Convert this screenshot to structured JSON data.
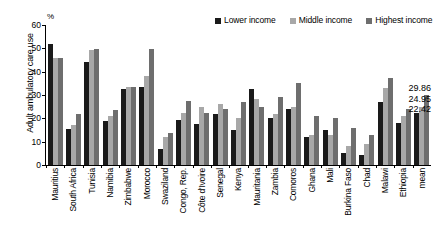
{
  "chart_data": {
    "type": "bar",
    "title": "",
    "xlabel": "",
    "ylabel": "Adult ambulatory care use",
    "unit_label": "%",
    "ylim": [
      0,
      60
    ],
    "yticks": [
      0,
      10,
      20,
      30,
      40,
      50,
      60
    ],
    "grid": false,
    "legend_position": "top-right",
    "categories": [
      "Mauritius",
      "South Africa",
      "Tunisia",
      "Namibia",
      "Zimbabwe",
      "Morocco",
      "Swaziland",
      "Congo, Rep.",
      "Côte d'Ivoire",
      "Senegal",
      "Kenya",
      "Mauritania",
      "Zambia",
      "Comoros",
      "Ghana",
      "Mali",
      "Burkina Faso",
      "Chad",
      "Malawi",
      "Ethiopia",
      "mean"
    ],
    "series": [
      {
        "name": "Lower income",
        "color": "#1a1a1a",
        "values": [
          51.8,
          15.5,
          44.2,
          19.0,
          32.7,
          33.6,
          6.8,
          19.2,
          17.6,
          22.0,
          15.2,
          32.6,
          20.0,
          24.2,
          12.0,
          15.0,
          5.0,
          4.2,
          27.2,
          18.0,
          22.42
        ]
      },
      {
        "name": "Middle income",
        "color": "#a8a8a8",
        "values": [
          46.0,
          17.0,
          49.2,
          21.2,
          33.4,
          38.1,
          11.8,
          22.2,
          25.0,
          26.0,
          20.0,
          28.2,
          22.0,
          25.0,
          13.0,
          13.0,
          8.0,
          9.0,
          33.0,
          21.0,
          24.95
        ]
      },
      {
        "name": "Highest income",
        "color": "#6e6e6e",
        "values": [
          45.9,
          22.0,
          49.8,
          23.4,
          33.6,
          49.6,
          13.6,
          27.4,
          22.2,
          24.0,
          27.0,
          25.0,
          29.0,
          35.0,
          21.0,
          20.0,
          16.0,
          13.0,
          37.2,
          24.0,
          29.86
        ]
      }
    ],
    "annotations": [
      "29.86",
      "24.95",
      "22.42"
    ]
  },
  "legend": {
    "items": [
      {
        "label": "Lower income"
      },
      {
        "label": "Middle income"
      },
      {
        "label": "Highest income"
      }
    ]
  }
}
